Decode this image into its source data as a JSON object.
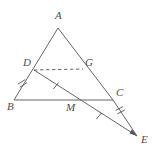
{
  "figure": {
    "kind": "geometry-diagram",
    "background_color": "#ffffff",
    "stroke_color": "#555555",
    "label_color": "#4d4d4d",
    "width": 157,
    "height": 154,
    "points": [
      {
        "id": "A",
        "label": "A",
        "x": 58,
        "y": 28,
        "label_x": 55,
        "label_y": 10
      },
      {
        "id": "D",
        "label": "D",
        "x": 34,
        "y": 70,
        "label_x": 23,
        "label_y": 57
      },
      {
        "id": "G",
        "label": "G",
        "x": 83,
        "y": 69,
        "label_x": 85,
        "label_y": 57
      },
      {
        "id": "B",
        "label": "B",
        "x": 14,
        "y": 100,
        "label_x": 7,
        "label_y": 101
      },
      {
        "id": "M",
        "label": "M",
        "x": 70,
        "y": 100,
        "label_x": 66,
        "label_y": 102
      },
      {
        "id": "C",
        "label": "C",
        "x": 113,
        "y": 100,
        "label_x": 116,
        "label_y": 87
      },
      {
        "id": "E",
        "label": "E",
        "x": 137,
        "y": 136,
        "label_x": 141,
        "label_y": 134
      }
    ],
    "segments": [
      {
        "id": "AB",
        "from": "A",
        "to": "B",
        "style": "solid"
      },
      {
        "id": "AC",
        "from": "A",
        "to": "C",
        "style": "solid"
      },
      {
        "id": "BC",
        "from": "B",
        "to": "C",
        "style": "solid"
      },
      {
        "id": "DG",
        "from": "D",
        "to": "G",
        "style": "dashed"
      },
      {
        "id": "DE",
        "from": "D",
        "to": "E",
        "style": "solid"
      },
      {
        "id": "CE",
        "from": "C",
        "to": "E",
        "style": "solid"
      }
    ],
    "tick_marks": [
      {
        "id": "tick-BD",
        "on": "BD",
        "count": 2,
        "x": 22,
        "y": 82
      },
      {
        "id": "tick-DM",
        "on": "DM",
        "count": 1,
        "x": 56,
        "y": 86
      },
      {
        "id": "tick-ME",
        "on": "ME",
        "count": 1,
        "x": 99,
        "y": 116
      },
      {
        "id": "tick-CE",
        "on": "CE",
        "count": 2,
        "x": 120,
        "y": 110
      }
    ]
  }
}
